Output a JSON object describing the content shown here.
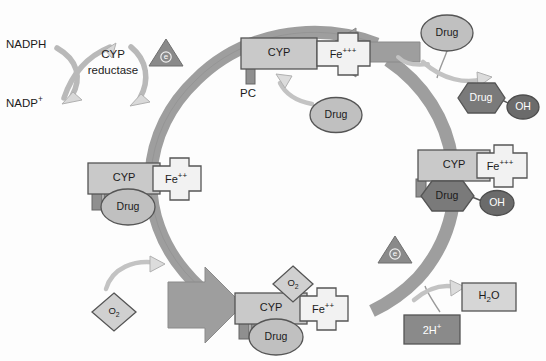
{
  "diagram": {
    "background_color": "#fdfdfd",
    "colors": {
      "ring": "#9e9e9e",
      "enzyme_fill": "#c9c9c9",
      "heme_fill": "#f2f2f2",
      "drug_light": "#c0c0c0",
      "drug_dark": "#7a7a7a",
      "oh_fill": "#6b6b6b",
      "triangle_fill": "#8a8a8a",
      "arrow_fill": "#d6d6d6",
      "arrow_stroke": "#9a9a9a",
      "stroke": "#555555",
      "text": "#1b1b1b"
    },
    "cofactors": {
      "nadph": "NADPH",
      "nadp_plus": "NADP+",
      "reductase_line1": "CYP",
      "reductase_line2": "reductase"
    },
    "electrons": [
      {
        "id": "electron-top",
        "label": "e"
      },
      {
        "id": "electron-right",
        "label": "e"
      }
    ],
    "complexes": [
      {
        "id": "complex-top",
        "enzyme": "CYP",
        "iron": "Fe",
        "iron_charge": "+++",
        "anchor_label": "PC",
        "substrate": null
      },
      {
        "id": "complex-right",
        "enzyme": "CYP",
        "iron": "Fe",
        "iron_charge": "+++",
        "substrate": "Drug",
        "substrate_style": "dark-hexagon",
        "metabolite_group": "OH"
      },
      {
        "id": "complex-left",
        "enzyme": "CYP",
        "iron": "Fe",
        "iron_charge": "++",
        "substrate": "Drug",
        "substrate_style": "light-ellipse"
      },
      {
        "id": "complex-bottom",
        "enzyme": "CYP",
        "iron": "Fe",
        "iron_charge": "++",
        "substrate": "Drug",
        "substrate_style": "light-ellipse",
        "bound_oxygen": "O2"
      }
    ],
    "free_species": [
      {
        "id": "drug-incoming-right",
        "label": "Drug",
        "shape": "ellipse-light"
      },
      {
        "id": "drug-incoming-center",
        "label": "Drug",
        "shape": "ellipse-light"
      },
      {
        "id": "drug-metabolite",
        "label": "Drug",
        "shape": "hexagon-dark"
      },
      {
        "id": "hydroxyl-product",
        "label": "OH",
        "shape": "circle-dark"
      },
      {
        "id": "oxygen-free",
        "label": "O2",
        "shape": "diamond-light"
      },
      {
        "id": "oxygen-bound",
        "label": "O2",
        "shape": "diamond-light"
      },
      {
        "id": "water-product",
        "label": "H2O",
        "shape": "rect-light"
      },
      {
        "id": "protons-input",
        "label": "2H+",
        "shape": "rect-dark"
      }
    ]
  }
}
